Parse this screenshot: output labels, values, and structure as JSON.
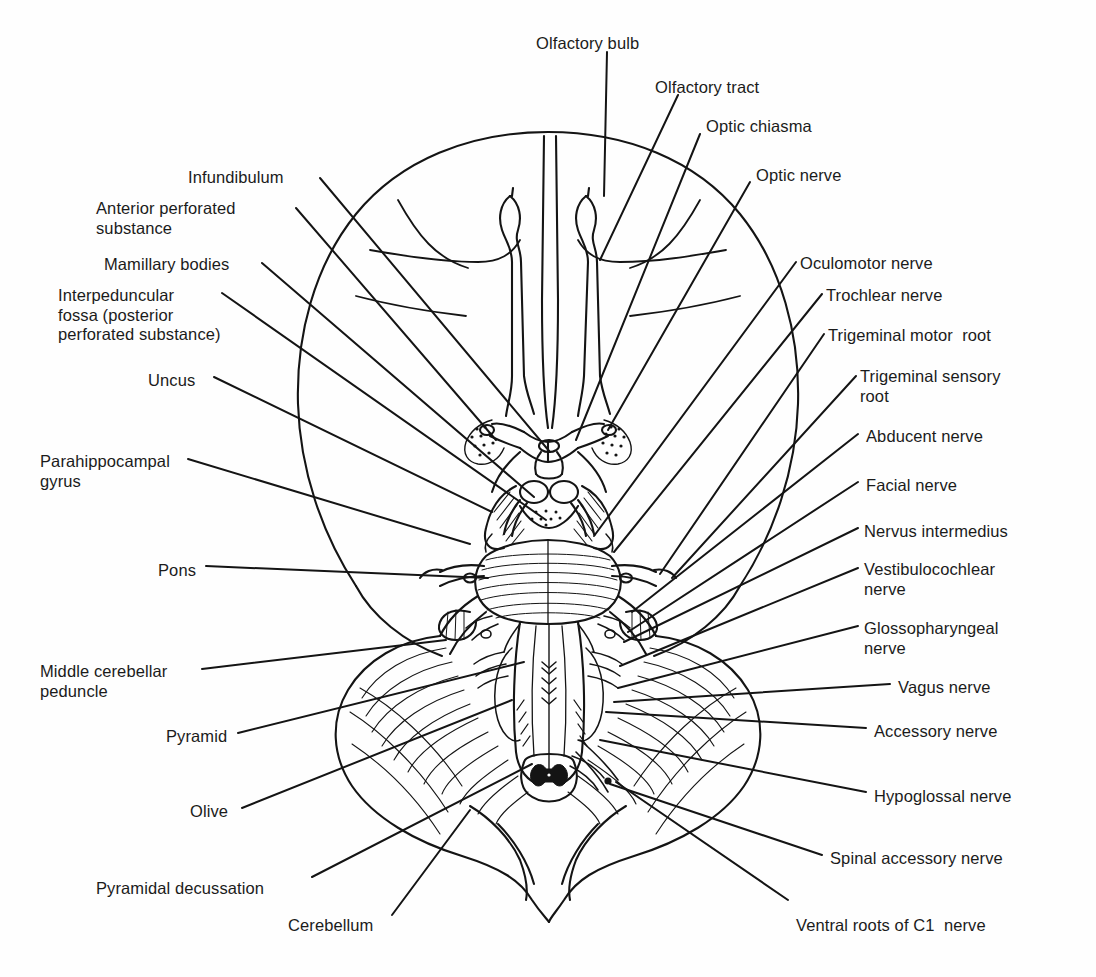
{
  "figure": {
    "type": "anatomical-line-diagram",
    "background_color": "#fefefe",
    "ink_color": "#141414",
    "caption": ""
  },
  "labels_left": [
    {
      "id": "infundibulum",
      "text": "Infundibulum",
      "x": 188,
      "y": 168,
      "lines": [
        "Infundibulum"
      ]
    },
    {
      "id": "anterior-perforated",
      "text": "Anterior perforated substance",
      "x": 96,
      "y": 199,
      "lines": [
        "Anterior perforated",
        "substance"
      ]
    },
    {
      "id": "mamillary-bodies",
      "text": "Mamillary bodies",
      "x": 104,
      "y": 255,
      "lines": [
        "Mamillary bodies"
      ]
    },
    {
      "id": "interpeduncular-fossa",
      "text": "Interpeduncular fossa (posterior perforated substance)",
      "x": 58,
      "y": 286,
      "lines": [
        "Interpeduncular",
        "fossa (posterior",
        "perforated substance)"
      ]
    },
    {
      "id": "uncus",
      "text": "Uncus",
      "x": 148,
      "y": 371,
      "lines": [
        "Uncus"
      ]
    },
    {
      "id": "parahippocampal-gyrus",
      "text": "Parahippocampal gyrus",
      "x": 40,
      "y": 452,
      "lines": [
        "Parahippocampal",
        "gyrus"
      ]
    },
    {
      "id": "pons",
      "text": "Pons",
      "x": 158,
      "y": 561,
      "lines": [
        "Pons"
      ]
    },
    {
      "id": "middle-cerebellar-peduncle",
      "text": "Middle cerebellar peduncle",
      "x": 40,
      "y": 662,
      "lines": [
        "Middle cerebellar",
        "peduncle"
      ]
    },
    {
      "id": "pyramid",
      "text": "Pyramid",
      "x": 166,
      "y": 727,
      "lines": [
        "Pyramid"
      ]
    },
    {
      "id": "olive",
      "text": "Olive",
      "x": 190,
      "y": 802,
      "lines": [
        "Olive"
      ]
    },
    {
      "id": "pyramidal-decussation",
      "text": "Pyramidal decussation",
      "x": 96,
      "y": 879,
      "lines": [
        "Pyramidal decussation"
      ]
    },
    {
      "id": "cerebellum",
      "text": "Cerebellum",
      "x": 288,
      "y": 916,
      "lines": [
        "Cerebellum"
      ]
    }
  ],
  "labels_right": [
    {
      "id": "olfactory-bulb",
      "text": "Olfactory bulb",
      "x": 536,
      "y": 34,
      "lines": [
        "Olfactory bulb"
      ]
    },
    {
      "id": "olfactory-tract",
      "text": "Olfactory tract",
      "x": 655,
      "y": 78,
      "lines": [
        "Olfactory tract"
      ]
    },
    {
      "id": "optic-chiasma",
      "text": "Optic chiasma",
      "x": 706,
      "y": 117,
      "lines": [
        "Optic chiasma"
      ]
    },
    {
      "id": "optic-nerve",
      "text": "Optic nerve",
      "x": 756,
      "y": 166,
      "lines": [
        "Optic nerve"
      ]
    },
    {
      "id": "oculomotor-nerve",
      "text": "Oculomotor nerve",
      "x": 800,
      "y": 254,
      "lines": [
        "Oculomotor nerve"
      ]
    },
    {
      "id": "trochlear-nerve",
      "text": "Trochlear nerve",
      "x": 826,
      "y": 286,
      "lines": [
        "Trochlear nerve"
      ]
    },
    {
      "id": "trigeminal-motor-root",
      "text": "Trigeminal motor  root",
      "x": 828,
      "y": 326,
      "lines": [
        "Trigeminal motor  root"
      ]
    },
    {
      "id": "trigeminal-sensory-root",
      "text": "Trigeminal sensory root",
      "x": 860,
      "y": 367,
      "lines": [
        "Trigeminal sensory",
        "root"
      ]
    },
    {
      "id": "abducent-nerve",
      "text": "Abducent nerve",
      "x": 866,
      "y": 427,
      "lines": [
        "Abducent nerve"
      ]
    },
    {
      "id": "facial-nerve",
      "text": "Facial nerve",
      "x": 866,
      "y": 476,
      "lines": [
        "Facial nerve"
      ]
    },
    {
      "id": "nervus-intermedius",
      "text": "Nervus intermedius",
      "x": 864,
      "y": 522,
      "lines": [
        "Nervus intermedius"
      ]
    },
    {
      "id": "vestibulocochlear-nerve",
      "text": "Vestibulocochlear nerve",
      "x": 864,
      "y": 560,
      "lines": [
        "Vestibulocochlear",
        "nerve"
      ]
    },
    {
      "id": "glossopharyngeal-nerve",
      "text": "Glossopharyngeal nerve",
      "x": 864,
      "y": 619,
      "lines": [
        "Glossopharyngeal",
        "nerve"
      ]
    },
    {
      "id": "vagus-nerve",
      "text": "Vagus nerve",
      "x": 898,
      "y": 678,
      "lines": [
        "Vagus nerve"
      ]
    },
    {
      "id": "accessory-nerve",
      "text": "Accessory nerve",
      "x": 874,
      "y": 722,
      "lines": [
        "Accessory nerve"
      ]
    },
    {
      "id": "hypoglossal-nerve",
      "text": "Hypoglossal nerve",
      "x": 874,
      "y": 787,
      "lines": [
        "Hypoglossal nerve"
      ]
    },
    {
      "id": "spinal-accessory-nerve",
      "text": "Spinal accessory nerve",
      "x": 830,
      "y": 849,
      "lines": [
        "Spinal accessory nerve"
      ]
    },
    {
      "id": "ventral-roots-c1",
      "text": "Ventral roots of C1  nerve",
      "x": 796,
      "y": 916,
      "lines": [
        "Ventral roots of C1  nerve"
      ]
    }
  ]
}
